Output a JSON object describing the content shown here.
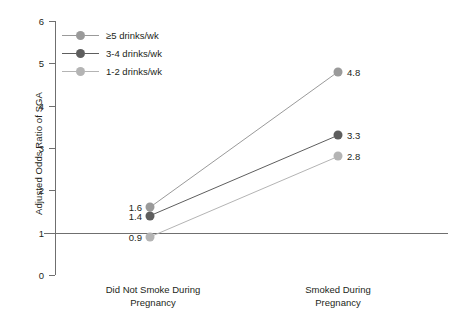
{
  "chart_data": {
    "type": "line",
    "title": "",
    "xlabel": "",
    "ylabel": "Adjusted Odds Ratio of SGA",
    "categories": [
      "Did Not Smoke During\nPregnancy",
      "Smoked During\nPregnancy"
    ],
    "category_lines": [
      [
        "Did Not Smoke During",
        "Pregnancy"
      ],
      [
        "Smoked During",
        "Pregnancy"
      ]
    ],
    "ylim": [
      0,
      6
    ],
    "yticks": [
      0,
      1,
      2,
      3,
      4,
      5,
      6
    ],
    "ytick_labels": [
      "0",
      "1",
      "2",
      "3",
      "4",
      "5",
      "6"
    ],
    "grid": false,
    "legend_position": "upper-left-inside",
    "reference_line": {
      "y": 1,
      "color": "#6f6f6f"
    },
    "series": [
      {
        "name": "≥5 drinks/wk",
        "color": "#9a9a9a",
        "values": [
          1.6,
          4.8
        ],
        "labels": [
          "1.6",
          "4.8"
        ]
      },
      {
        "name": "3-4 drinks/wk",
        "color": "#5e5e5e",
        "values": [
          1.4,
          3.3
        ],
        "labels": [
          "1.4",
          "3.3"
        ]
      },
      {
        "name": "1-2 drinks/wk",
        "color": "#b4b4b4",
        "values": [
          0.9,
          2.8
        ],
        "labels": [
          "0.9",
          "2.8"
        ]
      }
    ]
  },
  "axis": {
    "tick_0": "0",
    "tick_1": "1",
    "tick_2": "2",
    "tick_3": "3",
    "tick_4": "4",
    "tick_5": "5",
    "tick_6": "6",
    "y_title": "Adjusted Odds Ratio of SGA"
  },
  "legend": {
    "item_0": "≥5 drinks/wk",
    "item_1": "3-4 drinks/wk",
    "item_2": "1-2 drinks/wk"
  },
  "categories": {
    "left_line_1": "Did Not Smoke During",
    "left_line_2": "Pregnancy",
    "right_line_1": "Smoked During",
    "right_line_2": "Pregnancy"
  },
  "values": {
    "s0_left": "1.6",
    "s0_right": "4.8",
    "s1_left": "1.4",
    "s1_right": "3.3",
    "s2_left": "0.9",
    "s2_right": "2.8"
  }
}
